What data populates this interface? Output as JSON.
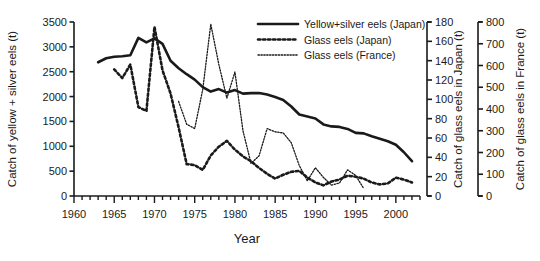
{
  "chart_data": {
    "type": "line",
    "title": "",
    "xlabel": "Year",
    "grid": false,
    "legend_position": "top-right",
    "xlim": [
      1960,
      2003
    ],
    "xticks": [
      1960,
      1965,
      1970,
      1975,
      1980,
      1985,
      1990,
      1995,
      2000
    ],
    "xtick_labels": [
      "1960",
      "1965",
      "1970",
      "1975",
      "1980",
      "1985",
      "1990",
      "1995",
      "2000"
    ],
    "xminor_step": 1,
    "axes": [
      {
        "id": "left",
        "label": "Catch of yellow + silver eels (t)",
        "ylim": [
          0,
          3500
        ],
        "ticks": [
          0,
          500,
          1000,
          1500,
          2000,
          2500,
          3000,
          3500
        ],
        "tick_labels": [
          "0",
          "500",
          "1000",
          "1500",
          "2000",
          "2500",
          "3000",
          "3500"
        ]
      },
      {
        "id": "right1",
        "label": "Catch of glass eels in Japan (t)",
        "ylim": [
          0,
          180
        ],
        "ticks": [
          0,
          20,
          40,
          60,
          80,
          100,
          120,
          140,
          160,
          180
        ],
        "tick_labels": [
          "0",
          "20",
          "40",
          "60",
          "80",
          "100",
          "120",
          "140",
          "160",
          "180"
        ]
      },
      {
        "id": "right2",
        "label": "Catch of glass eels in France (t)",
        "ylim": [
          0,
          800
        ],
        "ticks": [
          0,
          100,
          200,
          300,
          400,
          500,
          600,
          700,
          800
        ],
        "tick_labels": [
          "0",
          "100",
          "200",
          "300",
          "400",
          "500",
          "600",
          "700",
          "800"
        ]
      }
    ],
    "series": [
      {
        "name": "Yellow+silver eels (Japan)",
        "axis": "left",
        "style": "solid",
        "x": [
          1963,
          1964,
          1965,
          1966,
          1967,
          1968,
          1969,
          1970,
          1971,
          1972,
          1973,
          1974,
          1975,
          1976,
          1977,
          1978,
          1979,
          1980,
          1981,
          1982,
          1983,
          1984,
          1985,
          1986,
          1987,
          1988,
          1989,
          1990,
          1991,
          1992,
          1993,
          1994,
          1995,
          1996,
          1997,
          1998,
          1999,
          2000,
          2001,
          2002
        ],
        "y": [
          2690,
          2770,
          2800,
          2810,
          2830,
          3180,
          3090,
          3170,
          3060,
          2720,
          2570,
          2450,
          2340,
          2190,
          2100,
          2150,
          2080,
          2130,
          2060,
          2070,
          2070,
          2040,
          1990,
          1930,
          1800,
          1640,
          1600,
          1560,
          1440,
          1400,
          1390,
          1350,
          1270,
          1260,
          1200,
          1150,
          1100,
          1030,
          880,
          700
        ]
      },
      {
        "name": "Glass eels (Japan)",
        "axis": "right1",
        "style": "dotted-thick",
        "x": [
          1965,
          1966,
          1967,
          1968,
          1969,
          1970,
          1971,
          1972,
          1973,
          1974,
          1975,
          1976,
          1977,
          1978,
          1979,
          1980,
          1981,
          1982,
          1983,
          1984,
          1985,
          1986,
          1987,
          1988,
          1989,
          1990,
          1991,
          1992,
          1993,
          1994,
          1995,
          1996,
          1997,
          1998,
          1999,
          2000,
          2001,
          2002
        ],
        "y": [
          131,
          122,
          136,
          92,
          88,
          175,
          130,
          106,
          71,
          33,
          32,
          27,
          42,
          51,
          57,
          48,
          41,
          36,
          29,
          23,
          18,
          22,
          25,
          26,
          19,
          14,
          11,
          15,
          17,
          21,
          20,
          18,
          14,
          12,
          13,
          19,
          17,
          14
        ]
      },
      {
        "name": "Glass eels (France)",
        "axis": "right2",
        "style": "dotted-fine",
        "x": [
          1973,
          1974,
          1975,
          1976,
          1977,
          1978,
          1979,
          1980,
          1981,
          1982,
          1983,
          1984,
          1985,
          1986,
          1987,
          1988,
          1989,
          1990,
          1991,
          1992,
          1993,
          1994,
          1995,
          1996
        ],
        "y": [
          435,
          330,
          310,
          490,
          790,
          605,
          450,
          570,
          300,
          150,
          185,
          310,
          295,
          290,
          245,
          140,
          70,
          130,
          85,
          50,
          60,
          120,
          95,
          35
        ]
      }
    ]
  },
  "legend": {
    "items": [
      {
        "label": "Yellow+silver eels (Japan)",
        "style": "solid"
      },
      {
        "label": "Glass eels (Japan)",
        "style": "dotted-thick"
      },
      {
        "label": "Glass eels (France)",
        "style": "dotted-fine"
      }
    ]
  },
  "colors": {
    "ink": "#1a1a1a",
    "background": "#ffffff"
  }
}
